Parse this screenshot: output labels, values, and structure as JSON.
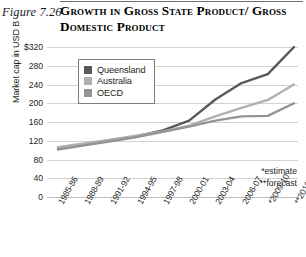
{
  "figure": {
    "number": "Figure 7.26",
    "title_line1": "Growth in Gross State Product/",
    "title_line2": "Gross Domestic Product"
  },
  "footnotes": {
    "estimate": "*estimate",
    "forecast": "**forecast"
  },
  "legend": {
    "items": [
      {
        "label": "Queensland",
        "color": "#595959"
      },
      {
        "label": "Australia",
        "color": "#b0b0b0"
      },
      {
        "label": "OECD",
        "color": "#949494"
      }
    ]
  },
  "chart_data": {
    "type": "line",
    "xlabel": "",
    "ylabel": "Market cap in USD B",
    "ylim": [
      0,
      320
    ],
    "yticks": [
      0,
      40,
      80,
      120,
      160,
      200,
      240,
      280,
      320
    ],
    "ytick_labels": [
      "0",
      "40",
      "80",
      "120",
      "160",
      "200",
      "240",
      "280",
      "$320"
    ],
    "grid": true,
    "legend_position": "upper-left",
    "categories": [
      "1985-86",
      "1988-89",
      "1991-92",
      "1994-95",
      "1997-98",
      "2000-01",
      "2003-04",
      "2006-07",
      "*2009-10",
      "**2012-13"
    ],
    "series": [
      {
        "name": "Queensland",
        "color": "#595959",
        "values": [
          103,
          112,
          121,
          130,
          142,
          163,
          208,
          243,
          262,
          320
        ]
      },
      {
        "name": "Australia",
        "color": "#b0b0b0",
        "values": [
          106,
          114,
          122,
          131,
          140,
          152,
          172,
          190,
          207,
          240
        ]
      },
      {
        "name": "OECD",
        "color": "#949494",
        "values": [
          101,
          110,
          119,
          128,
          139,
          150,
          163,
          172,
          173,
          200
        ]
      }
    ],
    "annotations": [
      "*estimate",
      "**forecast"
    ]
  }
}
